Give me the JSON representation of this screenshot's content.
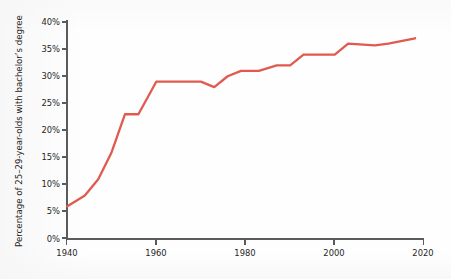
{
  "chart_data": {
    "type": "line",
    "title": "",
    "subtitle": "",
    "xlabel": "",
    "ylabel": "Percentage of 25–29-year-olds with bachelor’s degree",
    "xlim": [
      1940,
      2020
    ],
    "ylim": [
      0,
      40
    ],
    "grid": false,
    "legend": "none",
    "x_ticks": [
      1940,
      1960,
      1980,
      2000,
      2020
    ],
    "x_tick_labels": [
      "1940",
      "1960",
      "1980",
      "2000",
      "2020"
    ],
    "y_ticks": [
      0,
      5,
      10,
      15,
      20,
      25,
      30,
      35,
      40
    ],
    "y_tick_labels": [
      "0%",
      "5%",
      "10%",
      "15%",
      "20%",
      "25%",
      "30%",
      "35%",
      "40%"
    ],
    "series": [
      {
        "name": "Percentage of 25–29-year-olds with bachelor’s degree",
        "color": "#e05a4f",
        "x": [
          1940,
          1944,
          1947,
          1950,
          1953,
          1956,
          1960,
          1970,
          1973,
          1976,
          1979,
          1983,
          1987,
          1990,
          1993,
          2000,
          2003,
          2009,
          2012,
          2018
        ],
        "y": [
          6.0,
          8.0,
          11.0,
          16.0,
          23.0,
          23.0,
          29.0,
          29.0,
          28.0,
          30.0,
          31.0,
          31.0,
          32.0,
          32.0,
          34.0,
          34.0,
          36.0,
          35.7,
          36.0,
          37.0
        ]
      }
    ]
  },
  "axis": {
    "line_color": "#5b5b5b"
  }
}
